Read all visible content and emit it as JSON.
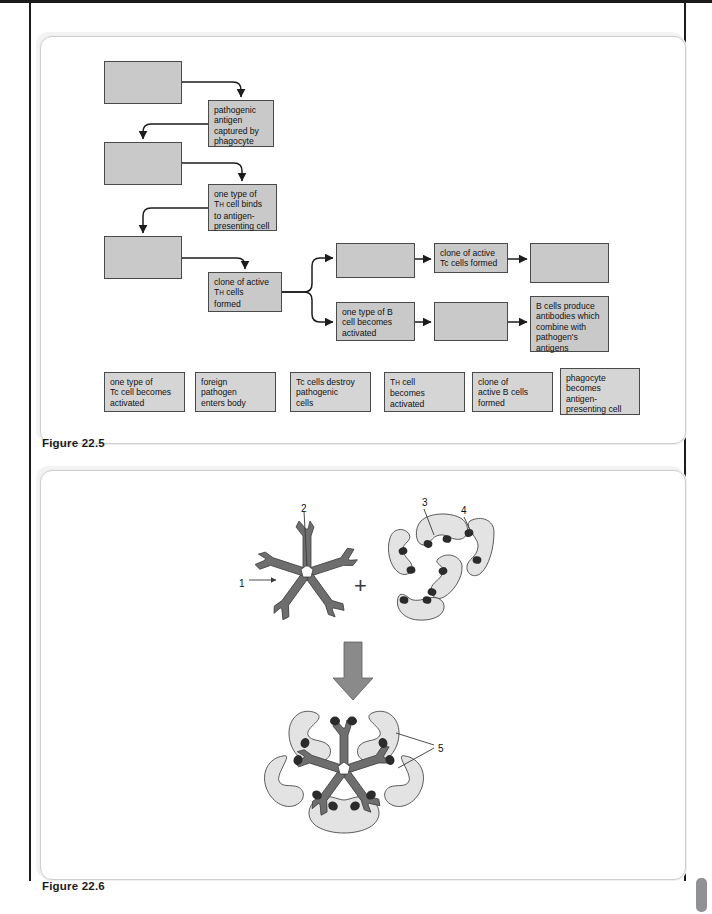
{
  "page": {
    "background": "#ffffff",
    "rule_color": "#1b1b1b",
    "tab_color": "#8f9194"
  },
  "figure_22_5": {
    "caption": "Figure 22.5",
    "box_fill": "#c9c9c9",
    "answer_fill": "#d5d5d5",
    "border": "#4a4a4a",
    "flow_boxes": [
      {
        "id": "b1",
        "label": "",
        "x": 104,
        "y": 61,
        "w": 78,
        "h": 43,
        "empty": true
      },
      {
        "id": "b2",
        "label": "pathogenic\nantigen\ncaptured by\nphagocyte",
        "x": 208,
        "y": 100,
        "w": 66,
        "h": 47,
        "empty": false
      },
      {
        "id": "b3",
        "label": "",
        "x": 104,
        "y": 142,
        "w": 78,
        "h": 43,
        "empty": true
      },
      {
        "id": "b4",
        "label": "one type of\nTH cell binds\nto antigen-\npresenting cell",
        "x": 208,
        "y": 184,
        "w": 69,
        "h": 47,
        "empty": false,
        "sub_after": "T"
      },
      {
        "id": "b5",
        "label": "",
        "x": 104,
        "y": 236,
        "w": 78,
        "h": 43,
        "empty": true
      },
      {
        "id": "b6",
        "label": "clone of active\nTH cells\nformed",
        "x": 208,
        "y": 272,
        "w": 74,
        "h": 40,
        "empty": false,
        "sub_after": "T"
      },
      {
        "id": "b7",
        "label": "",
        "x": 336,
        "y": 243,
        "w": 79,
        "h": 35,
        "empty": true
      },
      {
        "id": "b8",
        "label": "clone of active\nTc cells formed",
        "x": 434,
        "y": 243,
        "w": 74,
        "h": 30,
        "empty": false
      },
      {
        "id": "b9",
        "label": "",
        "x": 530,
        "y": 243,
        "w": 79,
        "h": 40,
        "empty": true
      },
      {
        "id": "b10",
        "label": "one type of B\ncell becomes\nactivated",
        "x": 336,
        "y": 302,
        "w": 79,
        "h": 39,
        "empty": false
      },
      {
        "id": "b11",
        "label": "",
        "x": 434,
        "y": 302,
        "w": 74,
        "h": 39,
        "empty": true
      },
      {
        "id": "b12",
        "label": "B cells produce\nantibodies which\ncombine with\npathogen's\nantigens",
        "x": 530,
        "y": 296,
        "w": 79,
        "h": 56,
        "empty": false
      }
    ],
    "answer_boxes": [
      {
        "id": "a1",
        "label": "one type of\nTc cell becomes\nactivated",
        "x": 104,
        "y": 372,
        "w": 81,
        "h": 40
      },
      {
        "id": "a2",
        "label": "foreign\npathogen\nenters body",
        "x": 195,
        "y": 372,
        "w": 81,
        "h": 40
      },
      {
        "id": "a3",
        "label": "Tc cells destroy\npathogenic\ncells",
        "x": 290,
        "y": 372,
        "w": 81,
        "h": 40
      },
      {
        "id": "a4",
        "label": "TH cell\nbecomes\nactivated",
        "x": 384,
        "y": 372,
        "w": 81,
        "h": 40,
        "sub_after": "T"
      },
      {
        "id": "a5",
        "label": "clone of\nactive B cells\nformed",
        "x": 472,
        "y": 372,
        "w": 81,
        "h": 40
      },
      {
        "id": "a6",
        "label": "phagocyte\nbecomes\nantigen-\npresenting cell",
        "x": 560,
        "y": 368,
        "w": 80,
        "h": 47
      }
    ]
  },
  "figure_22_6": {
    "caption": "Figure 22.6",
    "antibody_fill": "#6e6e6e",
    "antigen_fill": "#e3e3e3",
    "epitope_fill": "#2b2b2b",
    "arrow_fill": "#8a8a8a",
    "plus_sign": "+",
    "labels": [
      {
        "text": "1",
        "x": 239,
        "y": 578
      },
      {
        "text": "2",
        "x": 301,
        "y": 503
      },
      {
        "text": "3",
        "x": 422,
        "y": 497
      },
      {
        "text": "4",
        "x": 461,
        "y": 505
      },
      {
        "text": "5",
        "x": 438,
        "y": 743
      }
    ]
  }
}
